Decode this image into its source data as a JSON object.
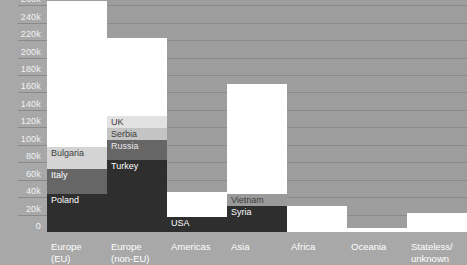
{
  "chart_data": {
    "type": "bar",
    "subtype": "stacked-bar",
    "title": "",
    "xlabel": "",
    "ylabel": "",
    "ylim": [
      0,
      266
    ],
    "unit": "thousands",
    "grid": true,
    "legend": "none (in-bar segment labels)",
    "ytick_labels": [
      "260k",
      "240k",
      "220k",
      "200k",
      "180k",
      "160k",
      "140k",
      "120k",
      "100k",
      "80k",
      "60k",
      "40k",
      "20k",
      "0"
    ],
    "ytick_values": [
      260,
      240,
      220,
      200,
      180,
      160,
      140,
      120,
      100,
      80,
      60,
      40,
      20,
      0
    ],
    "categories": [
      "Europe\n(EU)",
      "Europe\n(non-EU)",
      "Americas",
      "Asia",
      "Africa",
      "Oceania",
      "Stateless/\nunknown"
    ],
    "totals": [
      265,
      222,
      46,
      170,
      30,
      5,
      22
    ],
    "bars": [
      {
        "category": "Europe (EU)",
        "total": 265,
        "segments": [
          {
            "label": "Poland",
            "value": 44,
            "color": "#2e2e2e",
            "label_color": "dark"
          },
          {
            "label": "Italy",
            "value": 28,
            "color": "#666666",
            "label_color": "dark"
          },
          {
            "label": "Bulgaria",
            "value": 25,
            "color": "#d4d4d4",
            "label_color": "light"
          },
          {
            "label": "",
            "value": 168,
            "color": "#ffffff",
            "label_color": "light"
          }
        ]
      },
      {
        "category": "Europe (non-EU)",
        "total": 222,
        "segments": [
          {
            "label": "Turkey",
            "value": 83,
            "color": "#2e2e2e",
            "label_color": "dark"
          },
          {
            "label": "Russia",
            "value": 23,
            "color": "#666666",
            "label_color": "mid"
          },
          {
            "label": "Serbia",
            "value": 13,
            "color": "#c4c4c4",
            "label_color": "light"
          },
          {
            "label": "UK",
            "value": 14,
            "color": "#e2e2e2",
            "label_color": "light"
          },
          {
            "label": "",
            "value": 89,
            "color": "#ffffff",
            "label_color": "light"
          }
        ]
      },
      {
        "category": "Americas",
        "total": 46,
        "segments": [
          {
            "label": "USA",
            "value": 17,
            "color": "#2e2e2e",
            "label_color": "dark"
          },
          {
            "label": "",
            "value": 29,
            "color": "#ffffff",
            "label_color": "light"
          }
        ]
      },
      {
        "category": "Asia",
        "total": 170,
        "segments": [
          {
            "label": "Syria",
            "value": 30,
            "color": "#2e2e2e",
            "label_color": "dark"
          },
          {
            "label": "Vietnam",
            "value": 14,
            "color": "#9a9a9a",
            "label_color": "light"
          },
          {
            "label": "",
            "value": 126,
            "color": "#ffffff",
            "label_color": "light"
          }
        ]
      },
      {
        "category": "Africa",
        "total": 30,
        "segments": [
          {
            "label": "",
            "value": 30,
            "color": "#ffffff",
            "label_color": "light"
          }
        ]
      },
      {
        "category": "Oceania",
        "total": 5,
        "segments": [
          {
            "label": "",
            "value": 5,
            "color": "#ffffff",
            "label_color": "light"
          }
        ]
      },
      {
        "category": "Stateless/unknown",
        "total": 22,
        "segments": [
          {
            "label": "",
            "value": 22,
            "color": "#ffffff",
            "label_color": "light"
          }
        ]
      }
    ],
    "colors": {
      "background": "#a8a8a8",
      "plot_background": "#9e9e9e",
      "gridline": "#8a8a8a",
      "tick_text": "#f2f2f2",
      "category_text": "#ffffff"
    }
  }
}
